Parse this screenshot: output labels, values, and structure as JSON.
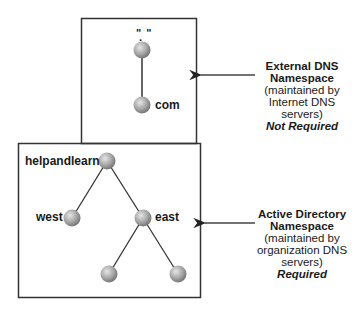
{
  "colors": {
    "line": "#333333",
    "node_light": "#d9d9d9",
    "node_dark": "#7a7a7a",
    "background": "#ffffff"
  },
  "external": {
    "root_label": "\" \"",
    "root_dot": ".",
    "tld_label": "com",
    "title_line1": "External DNS",
    "title_line2": "Namespace",
    "sub_line1": "(maintained by",
    "sub_line2": "Internet DNS",
    "sub_line3": "servers)",
    "requirement": "Not Required"
  },
  "internal": {
    "domain_label": "helpandlearn",
    "child_left_label": "west",
    "child_right_label": "east",
    "title_line1": "Active Directory",
    "title_line2": "Namespace",
    "sub_line1": "(maintained by",
    "sub_line2": "organization DNS",
    "sub_line3": "servers)",
    "requirement": "Required"
  }
}
